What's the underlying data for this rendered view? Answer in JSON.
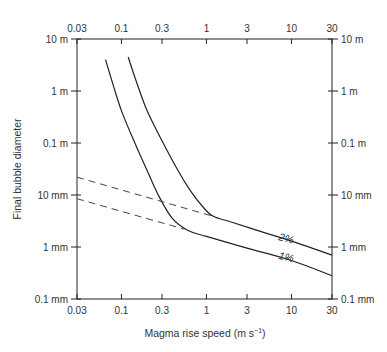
{
  "chart_data": {
    "type": "line",
    "title": "",
    "xlabel": "Magma rise speed (m s",
    "xlabel_sup": "−1",
    "xlabel_end": ")",
    "ylabel": "Final bubble diameter",
    "xscale": "log",
    "yscale": "log",
    "xlim": [
      0.03,
      30
    ],
    "ylim_mm": [
      0.1,
      10000
    ],
    "x_ticks": [
      {
        "value": 0.03,
        "label": "0.03"
      },
      {
        "value": 0.1,
        "label": "0.1"
      },
      {
        "value": 0.3,
        "label": "0.3"
      },
      {
        "value": 1,
        "label": "1"
      },
      {
        "value": 3,
        "label": "3"
      },
      {
        "value": 10,
        "label": "10"
      },
      {
        "value": 30,
        "label": "30"
      }
    ],
    "y_ticks": [
      {
        "value_mm": 10000,
        "label": "10 m"
      },
      {
        "value_mm": 1000,
        "label": "1 m"
      },
      {
        "value_mm": 100,
        "label": "0.1 m"
      },
      {
        "value_mm": 10,
        "label": "10 mm"
      },
      {
        "value_mm": 1,
        "label": "1 mm"
      },
      {
        "value_mm": 0.1,
        "label": "0.1 mm"
      }
    ],
    "grid": false,
    "legend": "none",
    "series": [
      {
        "name": "2%",
        "style": "solid",
        "label_at": {
          "x": 8.5,
          "y_mm": 1.25
        },
        "points": [
          {
            "x": 0.12,
            "y_mm": 4500
          },
          {
            "x": 0.15,
            "y_mm": 1500
          },
          {
            "x": 0.2,
            "y_mm": 420
          },
          {
            "x": 0.3,
            "y_mm": 110
          },
          {
            "x": 0.45,
            "y_mm": 32
          },
          {
            "x": 0.65,
            "y_mm": 12
          },
          {
            "x": 0.9,
            "y_mm": 6
          },
          {
            "x": 1.2,
            "y_mm": 3.9
          },
          {
            "x": 2,
            "y_mm": 3
          },
          {
            "x": 5,
            "y_mm": 1.85
          },
          {
            "x": 10,
            "y_mm": 1.3
          },
          {
            "x": 30,
            "y_mm": 0.7
          }
        ]
      },
      {
        "name": "1%",
        "style": "solid",
        "label_at": {
          "x": 8.5,
          "y_mm": 0.55
        },
        "points": [
          {
            "x": 0.065,
            "y_mm": 4000
          },
          {
            "x": 0.08,
            "y_mm": 1300
          },
          {
            "x": 0.1,
            "y_mm": 420
          },
          {
            "x": 0.14,
            "y_mm": 110
          },
          {
            "x": 0.2,
            "y_mm": 30
          },
          {
            "x": 0.28,
            "y_mm": 9
          },
          {
            "x": 0.4,
            "y_mm": 3.5
          },
          {
            "x": 0.6,
            "y_mm": 2.1
          },
          {
            "x": 1,
            "y_mm": 1.6
          },
          {
            "x": 3,
            "y_mm": 0.95
          },
          {
            "x": 10,
            "y_mm": 0.55
          },
          {
            "x": 30,
            "y_mm": 0.28
          }
        ]
      },
      {
        "name": "2% extrapolation",
        "style": "dashed",
        "points": [
          {
            "x": 0.03,
            "y_mm": 22
          },
          {
            "x": 1.2,
            "y_mm": 3.9
          }
        ]
      },
      {
        "name": "1% extrapolation",
        "style": "dashed",
        "points": [
          {
            "x": 0.03,
            "y_mm": 8.5
          },
          {
            "x": 0.55,
            "y_mm": 2.2
          }
        ]
      }
    ]
  }
}
